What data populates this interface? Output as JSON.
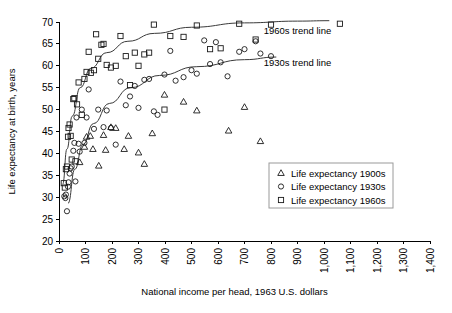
{
  "chart_data": {
    "type": "scatter",
    "title": "",
    "xlabel": "National income per head, 1963 U.S. dollars",
    "ylabel": "Life expectancy at birth, years",
    "xlim": [
      0,
      1400
    ],
    "ylim": [
      20,
      70
    ],
    "xticks": [
      0,
      100,
      200,
      300,
      400,
      500,
      600,
      700,
      800,
      900,
      1000,
      1100,
      1200,
      1300,
      1400
    ],
    "xticklabels": [
      "0",
      "100",
      "200",
      "300",
      "400",
      "500",
      "600",
      "700",
      "800",
      "900",
      "1,000",
      "1,100",
      "1,200",
      "1,300",
      "1,400"
    ],
    "yticks": [
      20,
      25,
      30,
      35,
      40,
      45,
      50,
      55,
      60,
      65,
      70
    ],
    "yticklabels": [
      "20",
      "25",
      "30",
      "35",
      "40",
      "45",
      "50",
      "55",
      "60",
      "65",
      "70"
    ],
    "grid": false,
    "legend_position": "center-right",
    "series": [
      {
        "name": "Life expectancy 1900s",
        "marker": "triangle",
        "points": [
          [
            78,
            38.0
          ],
          [
            96,
            41.5
          ],
          [
            104,
            43.8
          ],
          [
            118,
            44.0
          ],
          [
            128,
            41.0
          ],
          [
            150,
            37.2
          ],
          [
            168,
            44.2
          ],
          [
            176,
            40.8
          ],
          [
            196,
            46.0
          ],
          [
            214,
            45.8
          ],
          [
            246,
            41.0
          ],
          [
            262,
            44.0
          ],
          [
            300,
            40.2
          ],
          [
            322,
            37.6
          ],
          [
            352,
            44.6
          ],
          [
            398,
            53.4
          ],
          [
            470,
            51.8
          ],
          [
            520,
            49.8
          ],
          [
            640,
            45.2
          ],
          [
            700,
            50.6
          ],
          [
            760,
            42.8
          ]
        ]
      },
      {
        "name": "Life expectancy 1930s",
        "marker": "circle",
        "points": [
          [
            20,
            30.2
          ],
          [
            24,
            29.8
          ],
          [
            26,
            30.6
          ],
          [
            30,
            26.8
          ],
          [
            34,
            32.4
          ],
          [
            36,
            33.4
          ],
          [
            40,
            35.4
          ],
          [
            44,
            36.6
          ],
          [
            48,
            37.0
          ],
          [
            54,
            40.6
          ],
          [
            58,
            42.4
          ],
          [
            62,
            33.6
          ],
          [
            66,
            48.2
          ],
          [
            74,
            42.2
          ],
          [
            78,
            40.4
          ],
          [
            86,
            50.0
          ],
          [
            96,
            42.4
          ],
          [
            104,
            48.2
          ],
          [
            112,
            54.6
          ],
          [
            132,
            45.6
          ],
          [
            148,
            50.0
          ],
          [
            168,
            46.0
          ],
          [
            180,
            49.8
          ],
          [
            196,
            45.8
          ],
          [
            214,
            42.0
          ],
          [
            232,
            56.4
          ],
          [
            252,
            51.0
          ],
          [
            268,
            53.0
          ],
          [
            286,
            55.4
          ],
          [
            300,
            50.4
          ],
          [
            322,
            56.8
          ],
          [
            340,
            57.0
          ],
          [
            358,
            49.6
          ],
          [
            372,
            48.8
          ],
          [
            398,
            58.0
          ],
          [
            420,
            63.4
          ],
          [
            440,
            56.6
          ],
          [
            470,
            57.4
          ],
          [
            500,
            59.0
          ],
          [
            520,
            58.2
          ],
          [
            548,
            65.8
          ],
          [
            570,
            60.4
          ],
          [
            592,
            65.4
          ],
          [
            610,
            60.8
          ],
          [
            636,
            57.6
          ],
          [
            680,
            63.2
          ],
          [
            700,
            63.8
          ],
          [
            742,
            65.6
          ],
          [
            760,
            62.8
          ],
          [
            800,
            62.2
          ]
        ]
      },
      {
        "name": "Life expectancy 1960s",
        "marker": "square",
        "points": [
          [
            18,
            33.2
          ],
          [
            22,
            32.2
          ],
          [
            26,
            36.4
          ],
          [
            30,
            37.0
          ],
          [
            34,
            43.8
          ],
          [
            36,
            45.8
          ],
          [
            40,
            46.6
          ],
          [
            44,
            44.0
          ],
          [
            48,
            38.6
          ],
          [
            54,
            52.4
          ],
          [
            58,
            52.6
          ],
          [
            62,
            38.2
          ],
          [
            68,
            51.2
          ],
          [
            74,
            56.2
          ],
          [
            86,
            48.8
          ],
          [
            96,
            57.0
          ],
          [
            104,
            58.6
          ],
          [
            112,
            63.2
          ],
          [
            120,
            58.4
          ],
          [
            132,
            59.0
          ],
          [
            140,
            67.2
          ],
          [
            148,
            61.6
          ],
          [
            160,
            64.8
          ],
          [
            168,
            65.0
          ],
          [
            180,
            60.2
          ],
          [
            196,
            59.6
          ],
          [
            214,
            60.0
          ],
          [
            232,
            66.8
          ],
          [
            252,
            62.2
          ],
          [
            268,
            55.6
          ],
          [
            286,
            63.0
          ],
          [
            300,
            60.0
          ],
          [
            322,
            62.6
          ],
          [
            340,
            63.0
          ],
          [
            358,
            69.4
          ],
          [
            398,
            50.0
          ],
          [
            420,
            66.8
          ],
          [
            470,
            66.6
          ],
          [
            520,
            69.2
          ],
          [
            570,
            63.8
          ],
          [
            610,
            64.0
          ],
          [
            680,
            69.6
          ],
          [
            742,
            66.0
          ],
          [
            800,
            69.4
          ],
          [
            1060,
            69.6
          ]
        ]
      }
    ],
    "annotations": [
      {
        "text": "1960s trend line",
        "x": 900,
        "y": 67.2
      },
      {
        "text": "1930s trend line",
        "x": 900,
        "y": 60.0
      }
    ],
    "trend_lines": [
      {
        "name": "1960s trend line",
        "path": [
          [
            14,
            33.0
          ],
          [
            30,
            41.0
          ],
          [
            50,
            48.5
          ],
          [
            80,
            55.0
          ],
          [
            120,
            59.4
          ],
          [
            180,
            63.0
          ],
          [
            260,
            65.6
          ],
          [
            360,
            67.4
          ],
          [
            500,
            68.8
          ],
          [
            700,
            69.8
          ],
          [
            900,
            70.2
          ],
          [
            1020,
            70.3
          ]
        ]
      },
      {
        "name": "1930s trend line",
        "path": [
          [
            34,
            28.6
          ],
          [
            60,
            36.4
          ],
          [
            90,
            42.0
          ],
          [
            130,
            46.8
          ],
          [
            190,
            51.4
          ],
          [
            270,
            55.0
          ],
          [
            380,
            57.8
          ],
          [
            520,
            59.8
          ],
          [
            700,
            61.4
          ],
          [
            820,
            62.0
          ]
        ]
      }
    ]
  },
  "legend": {
    "entries": [
      {
        "marker": "triangle",
        "label": "Life expectancy 1900s"
      },
      {
        "marker": "circle",
        "label": "Life expectancy 1930s"
      },
      {
        "marker": "square",
        "label": "Life expectancy 1960s"
      }
    ]
  }
}
